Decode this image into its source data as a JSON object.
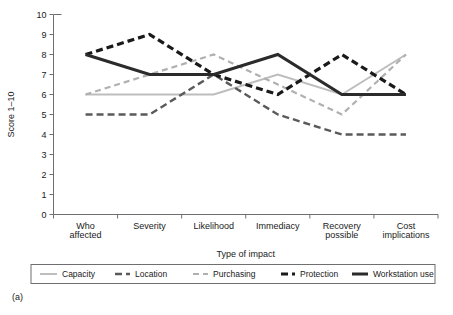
{
  "figure": {
    "panel_label": "(a)"
  },
  "chart_data": {
    "type": "line",
    "title": "",
    "xlabel": "Type of impact",
    "ylabel": "Score 1–10",
    "categories": [
      "Who affected",
      "Severity",
      "Likelihood",
      "Immediacy",
      "Recovery possible",
      "Cost implications"
    ],
    "category_lines": [
      [
        "Who",
        "affected"
      ],
      [
        "Severity"
      ],
      [
        "Likelihood"
      ],
      [
        "Immediacy"
      ],
      [
        "Recovery",
        "possible"
      ],
      [
        "Cost",
        "implications"
      ]
    ],
    "ylim": [
      0,
      10
    ],
    "yticks": [
      0,
      1,
      2,
      3,
      4,
      5,
      6,
      7,
      8,
      9,
      10
    ],
    "ytick_labels": [
      "0",
      "1",
      "2",
      "3",
      "4",
      "5",
      "6",
      "7",
      "8",
      "9",
      "10"
    ],
    "grid": false,
    "legend_position": "bottom",
    "series": [
      {
        "name": "Capacity",
        "values": [
          6,
          6,
          6,
          7,
          6,
          8
        ],
        "color": "#bdbdbd",
        "width": 2,
        "dash": "none"
      },
      {
        "name": "Location",
        "values": [
          5,
          5,
          7,
          5,
          4,
          4
        ],
        "color": "#5a5a5a",
        "width": 2.4,
        "dash": "7,4"
      },
      {
        "name": "Purchasing",
        "values": [
          6,
          7,
          8,
          6.5,
          5,
          8
        ],
        "color": "#b0b0b0",
        "width": 2.2,
        "dash": "6,4"
      },
      {
        "name": "Protection",
        "values": [
          8,
          9,
          7,
          6,
          8,
          6
        ],
        "color": "#1a1a1a",
        "width": 3.2,
        "dash": "7,4"
      },
      {
        "name": "Workstation use",
        "values": [
          8,
          7,
          7,
          8,
          6,
          6
        ],
        "color": "#2b2b2b",
        "width": 3,
        "dash": "none"
      }
    ]
  }
}
